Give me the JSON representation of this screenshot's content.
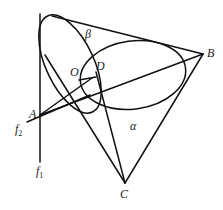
{
  "diagram": {
    "type": "geometry",
    "points": {
      "A": {
        "label": "A"
      },
      "B": {
        "label": "B"
      },
      "C": {
        "label": "C"
      },
      "O": {
        "label": "O"
      },
      "D": {
        "label": "D"
      }
    },
    "regions": {
      "alpha": {
        "label": "α"
      },
      "beta": {
        "label": "β"
      }
    },
    "lines": {
      "f1": {
        "label": "f",
        "subscript": "1"
      },
      "f2": {
        "label": "f",
        "subscript": "2"
      }
    }
  }
}
